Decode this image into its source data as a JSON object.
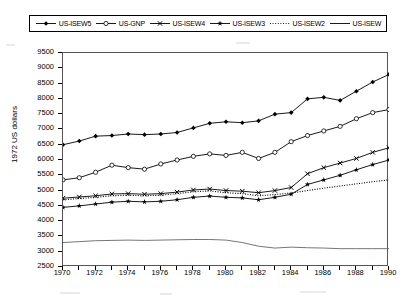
{
  "chart_data": {
    "type": "line",
    "title": "",
    "xlabel": "",
    "ylabel": "1972 US dollars",
    "xlim": [
      1970,
      1990
    ],
    "ylim": [
      2500,
      9500
    ],
    "grid": false,
    "legend_position": "top",
    "x": [
      1970,
      1971,
      1972,
      1973,
      1974,
      1975,
      1976,
      1977,
      1978,
      1979,
      1980,
      1981,
      1982,
      1983,
      1984,
      1985,
      1986,
      1987,
      1988,
      1989,
      1990
    ],
    "x_tick_labels": [
      "1970",
      "1972",
      "1974",
      "1976",
      "1978",
      "1980",
      "1982",
      "1984",
      "1986",
      "1988",
      "1990"
    ],
    "y_tick_labels": [
      "2500",
      "3000",
      "3500",
      "4000",
      "4500",
      "5000",
      "5500",
      "6000",
      "6500",
      "7000",
      "7500",
      "8000",
      "8500",
      "9000",
      "9500"
    ],
    "series": [
      {
        "name": "US-ISEW5",
        "marker": "filled-diamond",
        "style": "solid",
        "values": [
          6500,
          6620,
          6780,
          6800,
          6850,
          6830,
          6850,
          6900,
          7050,
          7200,
          7250,
          7220,
          7280,
          7500,
          7550,
          8000,
          8050,
          7950,
          8250,
          8550,
          8800
        ]
      },
      {
        "name": "US-GNP",
        "marker": "open-circle",
        "style": "solid",
        "values": [
          5350,
          5420,
          5600,
          5830,
          5750,
          5700,
          5870,
          6000,
          6120,
          6200,
          6150,
          6250,
          6050,
          6250,
          6600,
          6800,
          6950,
          7100,
          7350,
          7550,
          7650
        ]
      },
      {
        "name": "US-ISEW4",
        "marker": "cross-x",
        "style": "solid",
        "values": [
          4750,
          4790,
          4830,
          4890,
          4900,
          4880,
          4900,
          4950,
          5020,
          5050,
          5000,
          4980,
          4930,
          5000,
          5100,
          5550,
          5750,
          5900,
          6050,
          6250,
          6400
        ]
      },
      {
        "name": "US-ISEW3",
        "marker": "filled-star",
        "style": "solid",
        "values": [
          4450,
          4500,
          4560,
          4620,
          4650,
          4630,
          4650,
          4700,
          4780,
          4820,
          4780,
          4760,
          4700,
          4780,
          4880,
          5200,
          5350,
          5500,
          5680,
          5850,
          6000
        ]
      },
      {
        "name": "US-ISEW2",
        "marker": "none",
        "style": "dotted",
        "values": [
          4700,
          4740,
          4780,
          4830,
          4850,
          4830,
          4850,
          4900,
          4960,
          4990,
          4930,
          4900,
          4830,
          4870,
          4920,
          5000,
          5080,
          5150,
          5220,
          5290,
          5350
        ]
      },
      {
        "name": "US-ISEW",
        "marker": "none",
        "style": "solid-thin",
        "values": [
          3300,
          3330,
          3360,
          3370,
          3380,
          3370,
          3380,
          3390,
          3400,
          3400,
          3380,
          3300,
          3180,
          3120,
          3150,
          3130,
          3120,
          3100,
          3100,
          3100,
          3100
        ]
      }
    ]
  },
  "axes": {
    "y_title": "1972 US dollars"
  },
  "legend": {
    "items": [
      {
        "label": "US-ISEW5",
        "key": "filled-diamond-solid-line"
      },
      {
        "label": "US-GNP",
        "key": "open-circle-solid-line"
      },
      {
        "label": "US-ISEW4",
        "key": "cross-x-solid-line"
      },
      {
        "label": "US-ISEW3",
        "key": "filled-star-solid-line"
      },
      {
        "label": "US-ISEW2",
        "key": "dotted-line"
      },
      {
        "label": "US-ISEW",
        "key": "solid-line"
      }
    ]
  }
}
